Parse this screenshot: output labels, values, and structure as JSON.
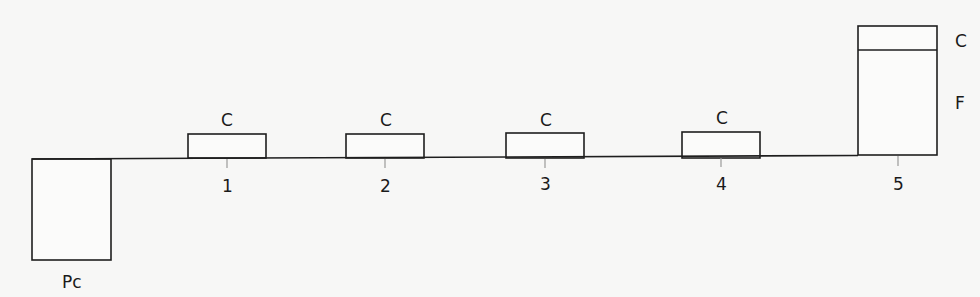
{
  "diagram": {
    "type": "cash-flow-timeline",
    "baseline": {
      "y": 158,
      "x_start": 32,
      "x_end": 937
    },
    "initial_outflow": {
      "label": "Pc",
      "x": 32,
      "width": 79,
      "depth": 102
    },
    "periods": [
      {
        "tick_label": "1",
        "flow_label": "C"
      },
      {
        "tick_label": "2",
        "flow_label": "C"
      },
      {
        "tick_label": "3",
        "flow_label": "C"
      },
      {
        "tick_label": "4",
        "flow_label": "C"
      },
      {
        "tick_label": "5",
        "flow_label": "C",
        "extra_label": "F"
      }
    ],
    "final_labels": {
      "coupon": "C",
      "face": "F"
    }
  }
}
